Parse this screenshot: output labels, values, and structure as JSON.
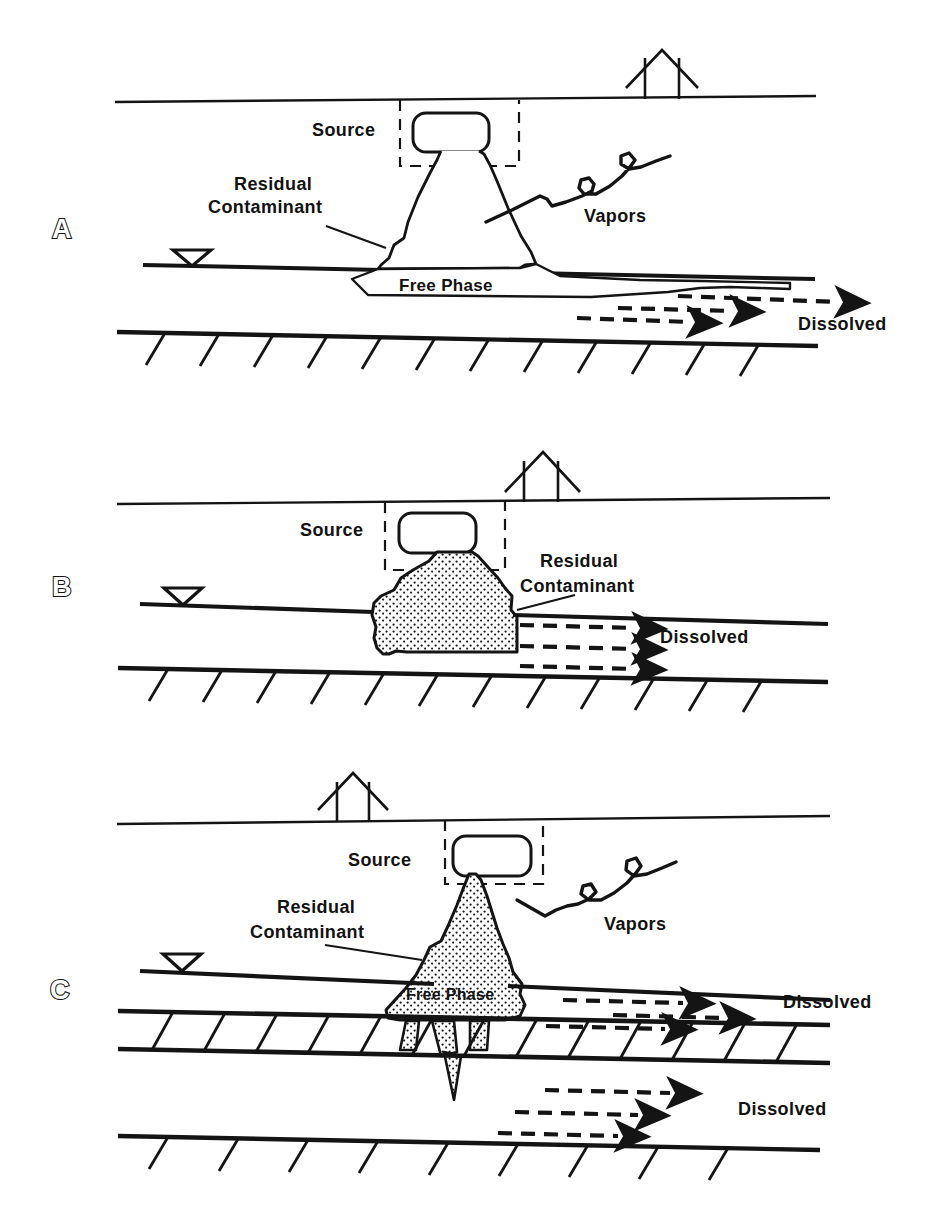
{
  "figure": {
    "title": "",
    "type": "cross-section-diagram",
    "panels": [
      {
        "id": "A",
        "letter": "A",
        "labels": {
          "source": "Source",
          "residual": "Residual\nContaminant",
          "residual_line1": "Residual",
          "residual_line2": "Contaminant",
          "vapors": "Vapors",
          "free_phase": "Free  Phase",
          "dissolved": "Dissolved"
        },
        "features": {
          "house": "house-icon",
          "water_table_symbol": "water-table-triangle-icon",
          "tank": "underground-storage-tank",
          "source_box": "dashed-source-boundary",
          "plume_fill": "outline",
          "dissolved_arrows": 3,
          "aquitard_hatch_marks": 12
        }
      },
      {
        "id": "B",
        "letter": "B",
        "labels": {
          "source": "Source",
          "residual_line1": "Residual",
          "residual_line2": "Contaminant",
          "dissolved": "Dissolved"
        },
        "features": {
          "house": "house-icon",
          "water_table_symbol": "water-table-triangle-icon",
          "tank": "underground-storage-tank",
          "source_box": "dashed-source-boundary",
          "plume_fill": "stippled",
          "dissolved_arrows": 3,
          "aquitard_hatch_marks": 12
        }
      },
      {
        "id": "C",
        "letter": "C",
        "labels": {
          "source": "Source",
          "residual_line1": "Residual",
          "residual_line2": "Contaminant",
          "vapors": "Vapors",
          "free_phase": "Free   Phase",
          "dissolved_upper": "Dissolved",
          "dissolved_lower": "Dissolved"
        },
        "features": {
          "house": "house-icon",
          "water_table_symbol": "water-table-triangle-icon",
          "tank": "underground-storage-tank",
          "source_box": "dashed-source-boundary",
          "plume_fill": "stippled",
          "confining_layer": "hatched-band",
          "dissolved_arrows_upper": 3,
          "dissolved_arrows_lower": 3,
          "aquitard_hatch_marks": 9
        }
      }
    ]
  },
  "colors": {
    "ink": "#141414",
    "paper": "#ffffff",
    "stipple": "#1a1a1a"
  }
}
